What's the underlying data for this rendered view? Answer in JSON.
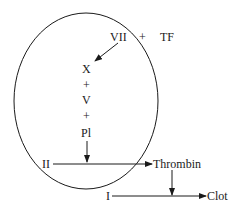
{
  "diagram": {
    "cofactors": {
      "vii": "VII",
      "plus": "+",
      "tf": "TF"
    },
    "complex": {
      "items": [
        "X",
        "+",
        "V",
        "+",
        "Pl"
      ]
    },
    "prothrombin": "II",
    "thrombin": "Thrombin",
    "fibrinogen": "I",
    "clot": "Clot",
    "colors": {
      "line": "#1a1a1a",
      "background": "#ffffff"
    }
  }
}
